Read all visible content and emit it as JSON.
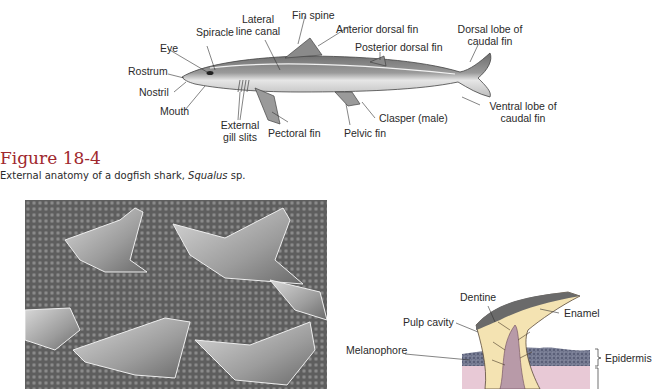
{
  "shark_diagram": {
    "labels": {
      "spiracle": "Spiracle",
      "lateral_line_1": "Lateral",
      "lateral_line_2": "line canal",
      "fin_spine": "Fin spine",
      "anterior_dorsal": "Anterior dorsal fin",
      "dorsal_lobe_1": "Dorsal lobe of",
      "dorsal_lobe_2": "caudal fin",
      "eye": "Eye",
      "posterior_dorsal": "Posterior dorsal fin",
      "rostrum": "Rostrum",
      "nostril": "Nostril",
      "mouth": "Mouth",
      "gill_1": "External",
      "gill_2": "gill slits",
      "pectoral": "Pectoral fin",
      "pelvic": "Pelvic fin",
      "clasper": "Clasper (male)",
      "ventral_lobe_1": "Ventral lobe of",
      "ventral_lobe_2": "caudal fin"
    }
  },
  "figure": {
    "title": "Figure 18-4",
    "caption_prefix": "External anatomy of a dogfish shark, ",
    "caption_species": "Squalus",
    "caption_suffix": " sp."
  },
  "scale_diagram": {
    "labels": {
      "dentine": "Dentine",
      "pulp_cavity": "Pulp cavity",
      "enamel": "Enamel",
      "melanophore": "Melanophore",
      "epidermis": "Epidermis"
    }
  },
  "colors": {
    "figure_title": "#a0282e",
    "dentine": "#f4e3b2",
    "pulp": "#b89aa8",
    "epidermis": "#5a5f78",
    "dermis": "#e8c9d6"
  }
}
